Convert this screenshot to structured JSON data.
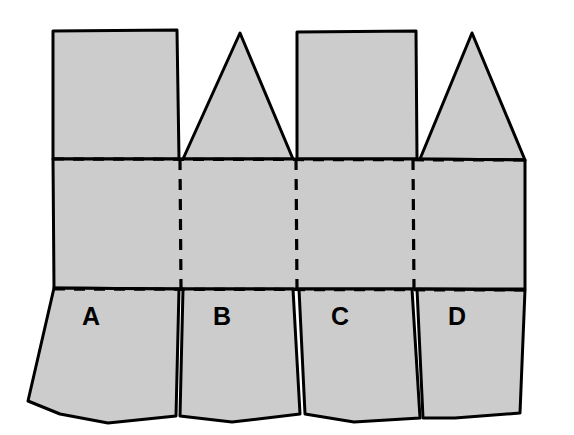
{
  "figure": {
    "kind": "line-drawing",
    "background_color": "#ffffff",
    "fill_color": "#cccccc",
    "stroke_color": "#000000",
    "dash_color": "#000000",
    "solid_stroke_width": 3,
    "dash_stroke_width": 3.2,
    "dash_pattern": "11 9",
    "canvas": {
      "width": 574,
      "height": 435
    }
  },
  "labels": {
    "items": [
      {
        "id": "a",
        "text": "A",
        "x": 91,
        "y": 318
      },
      {
        "id": "b",
        "text": "B",
        "x": 222,
        "y": 318
      },
      {
        "id": "c",
        "text": "C",
        "x": 340,
        "y": 318
      },
      {
        "id": "d",
        "text": "D",
        "x": 457,
        "y": 318
      }
    ]
  },
  "geometry": {
    "band": {
      "top_y": 159,
      "bottom_y": 289,
      "left_x": 53,
      "right_x": 525,
      "outline": "M 53,159 L 179,159 L 296,159 L 413,159 L 525,160 L 525,289 L 413,289 L 296,289 L 179,289 L 54,288 Z"
    },
    "top_flaps": [
      {
        "id": "top-flap-rect-1",
        "shape": "rectangle",
        "path": "M 53,159 L 53,31 L 177,30 L 179,159 Z"
      },
      {
        "id": "top-flap-triangle-1",
        "shape": "triangle",
        "path": "M 183,159 L 240,33 L 293,159 Z"
      },
      {
        "id": "top-flap-rect-2",
        "shape": "rectangle",
        "path": "M 297,159 L 297,32 L 416,31 L 417,159 Z"
      },
      {
        "id": "top-flap-triangle-2",
        "shape": "triangle",
        "path": "M 420,159 L 472,33 L 525,160 Z"
      }
    ],
    "bottom_flaps": [
      {
        "id": "bottom-flap-a",
        "label": "A",
        "path": "M 54,288 L 179,289 L 176,416 L 108,423 L 60,414 L 28,401 Z"
      },
      {
        "id": "bottom-flap-b",
        "label": "B",
        "path": "M 183,289 L 293,289 L 300,414 L 232,422 L 180,416 Z"
      },
      {
        "id": "bottom-flap-c",
        "label": "C",
        "path": "M 299,289 L 412,289 L 420,418 L 354,422 L 305,414 Z"
      },
      {
        "id": "bottom-flap-d",
        "label": "D",
        "path": "M 417,289 L 525,290 L 520,413 L 455,418 L 423,418 Z"
      }
    ],
    "fold_lines": {
      "horizontal": [
        {
          "id": "fold-top",
          "x1": 53,
          "y1": 159,
          "x2": 525,
          "y2": 160
        },
        {
          "id": "fold-bottom",
          "x1": 54,
          "y1": 289,
          "x2": 525,
          "y2": 290
        }
      ],
      "vertical": [
        {
          "id": "fold-v1",
          "x1": 180,
          "y1": 159,
          "x2": 181,
          "y2": 289
        },
        {
          "id": "fold-v2",
          "x1": 296,
          "y1": 159,
          "x2": 297,
          "y2": 289
        },
        {
          "id": "fold-v3",
          "x1": 413,
          "y1": 159,
          "x2": 414,
          "y2": 289
        }
      ]
    }
  }
}
